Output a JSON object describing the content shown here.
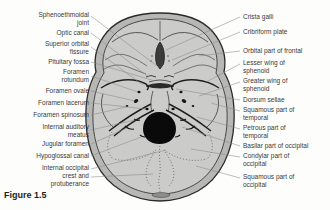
{
  "figure": {
    "caption": "Figure 1.5",
    "left_labels": [
      "Sphenoethmoidal joint",
      "Optic canal",
      "Superior orbital fissure",
      "Pituitary fossa",
      "Foramen rotundum",
      "Foramen ovale",
      "Foramen lacerum",
      "Foramen spinosum",
      "Internal auditory meatus",
      "Jugular foramen",
      "Hypoglossal canal",
      "Internal occipital crest and protuberance"
    ],
    "right_labels": [
      "Crista galli",
      "Cribriform plate",
      "Orbital part of frontal",
      "Lesser wing of sphenoid",
      "Greater wing of sphenoid",
      "Dorsum sellae",
      "Squamous part of temporal",
      "Petrous part of temporal",
      "Basilar part of occipital",
      "Condylar part of occipital",
      "Squamous part of occipital"
    ],
    "colors": {
      "background": "#fdfdfb",
      "skull_rim": "#b7b7b5",
      "skull_fill": "#cbcbc9",
      "outline": "#2b2b29",
      "detail_line": "#3a3a38",
      "leader_line": "#8a8a88",
      "text": "#3a3a38",
      "foramen_magnum": "#0a0a0a"
    }
  }
}
